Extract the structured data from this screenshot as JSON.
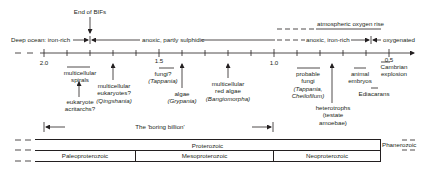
{
  "diagram": {
    "axis": {
      "unit": "Ga",
      "labels": [
        {
          "text": "2.0",
          "value": 2.0
        },
        {
          "text": "1.5",
          "value": 1.5
        },
        {
          "text": "1.0",
          "value": 1.0
        },
        {
          "text": "0.5",
          "value": 0.5
        }
      ],
      "tick_step": 0.1
    },
    "top_events": {
      "end_of_bifs": "End of BIFs",
      "atmospheric_oxygen_rise": "atmospheric oxygen rise"
    },
    "ocean_states": [
      {
        "label": "Deep ocean: iron-rich"
      },
      {
        "label": "anoxic, partly sulphidic"
      },
      {
        "label": "anoxic, iron-rich"
      },
      {
        "label": "oxygenated"
      }
    ],
    "fossil_events": [
      {
        "line1": "multicellular",
        "line2": "spirals"
      },
      {
        "line1": "eukaryote",
        "line2": "acritarchs?"
      },
      {
        "line1": "multicellular",
        "line2": "eukaryotes?",
        "line3": "(Qingshania)"
      },
      {
        "line1": "fungi?",
        "line2": "(Tappania)"
      },
      {
        "line1": "algae",
        "line2": "(Grypania)"
      },
      {
        "line1": "multicellular",
        "line2": "red algae",
        "line3": "(Bangiomorpha)"
      },
      {
        "line1": "probable",
        "line2": "fungi",
        "line3": "(Tappania,",
        "line4": "Cheilofilum)"
      },
      {
        "line1": "heterotrophs",
        "line2": "(testate",
        "line3": "amoebae)"
      },
      {
        "line1": "animal",
        "line2": "embryos"
      },
      {
        "line1": "Ediacarans"
      },
      {
        "line1": "Cambrian",
        "line2": "explosion"
      }
    ],
    "boring_billion": "The 'boring billion'",
    "eons": [
      {
        "label": "Proterozoic"
      },
      {
        "label": "Phanerozoic"
      }
    ],
    "eras": [
      {
        "label": "Paleoproterozoic"
      },
      {
        "label": "Mesoproterozoic"
      },
      {
        "label": "Neoproterozoic"
      }
    ]
  }
}
